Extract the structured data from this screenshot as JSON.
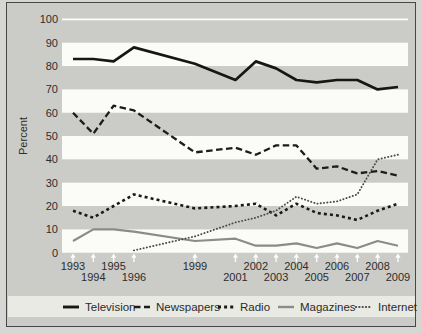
{
  "colors": {
    "band_white": "#fbfbf8",
    "band_gray": "#cbccc7",
    "legend_strip": "#e9eae4",
    "frame_border": "#47474a",
    "arrow": "#ffffff",
    "text": "#2d2d2d"
  },
  "chart_data": {
    "type": "line",
    "title": "",
    "xlabel": "",
    "ylabel": "Percent",
    "ylim": [
      0,
      100
    ],
    "xlim": [
      1993,
      2009
    ],
    "grid": "alternating horizontal bands, white gridline at 100",
    "legend_position": "bottom strip",
    "y_ticks": [
      100,
      90,
      80,
      70,
      60,
      50,
      40,
      30,
      20,
      10,
      0
    ],
    "x": [
      1993,
      1994,
      1995,
      1996,
      1999,
      2001,
      2002,
      2003,
      2004,
      2005,
      2006,
      2007,
      2008,
      2009
    ],
    "x_label_rows": {
      "row1": [
        1993,
        1995,
        1999,
        2002,
        2004,
        2006,
        2008
      ],
      "row2": [
        1994,
        1996,
        2001,
        2003,
        2005,
        2007,
        2009
      ]
    },
    "axis_arrow_years": [
      1993,
      1994,
      1995,
      1996,
      1999,
      2001,
      2002,
      2003,
      2004,
      2005,
      2006,
      2007,
      2008,
      2009
    ],
    "series": [
      {
        "name": "Television",
        "color": "#161616",
        "width": 2.7,
        "dash": "",
        "cap": "butt",
        "values": [
          83,
          83,
          82,
          88,
          81,
          74,
          82,
          79,
          74,
          73,
          74,
          74,
          70,
          71
        ]
      },
      {
        "name": "Newspapers",
        "color": "#1c1c1c",
        "width": 2.3,
        "dash": "6.5 3.5",
        "cap": "butt",
        "values": [
          60,
          51,
          63,
          61,
          43,
          45,
          42,
          46,
          46,
          36,
          37,
          34,
          35,
          33
        ]
      },
      {
        "name": "Radio",
        "color": "#1a1a1a",
        "width": 2.6,
        "dash": "3 3.1",
        "cap": "butt",
        "values": [
          18,
          15,
          20,
          25,
          19,
          20,
          21,
          16,
          21,
          17,
          16,
          14,
          18,
          21
        ]
      },
      {
        "name": "Magazines",
        "color": "#8b8b88",
        "width": 2.2,
        "dash": "",
        "cap": "butt",
        "values": [
          5,
          10,
          10,
          9,
          5,
          6,
          3,
          3,
          4,
          2,
          4,
          2,
          5,
          3
        ]
      },
      {
        "name": "Internet",
        "color": "#4b4b48",
        "width": 1.9,
        "dash": "0.2 3.1",
        "cap": "round",
        "values": [
          null,
          null,
          null,
          1,
          7,
          13,
          15,
          18,
          24,
          21,
          22,
          25,
          40,
          42
        ]
      }
    ]
  }
}
